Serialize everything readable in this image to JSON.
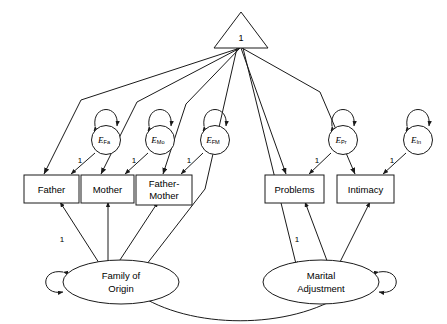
{
  "diagram": {
    "type": "sem-path-diagram",
    "constant": {
      "shape": "triangle",
      "label": "1",
      "name": "constant-triangle"
    },
    "latent_variables": [
      {
        "id": "family-of-origin",
        "label_line1": "Family of",
        "label_line2": "Origin",
        "shape": "ellipse",
        "self_loop": "left"
      },
      {
        "id": "marital-adjustment",
        "label_line1": "Marital",
        "label_line2": "Adjustment",
        "shape": "ellipse",
        "self_loop": "right"
      }
    ],
    "indicators": [
      {
        "id": "father",
        "label_line1": "Father",
        "label_line2": "",
        "shape": "rect"
      },
      {
        "id": "mother",
        "label_line1": "Mother",
        "label_line2": "",
        "shape": "rect"
      },
      {
        "id": "father-mother",
        "label_line1": "Father-",
        "label_line2": "Mother",
        "shape": "rect"
      },
      {
        "id": "problems",
        "label_line1": "Problems",
        "label_line2": "",
        "shape": "rect"
      },
      {
        "id": "intimacy",
        "label_line1": "Intimacy",
        "label_line2": "",
        "shape": "rect"
      }
    ],
    "errors": [
      {
        "id": "e-fa",
        "base": "E",
        "subscript": "Fa",
        "shape": "circle",
        "self_loop": "top"
      },
      {
        "id": "e-mo",
        "base": "E",
        "subscript": "Mo",
        "shape": "circle",
        "self_loop": "top"
      },
      {
        "id": "e-fm",
        "base": "E",
        "subscript": "FM",
        "shape": "circle",
        "self_loop": "top"
      },
      {
        "id": "e-pr",
        "base": "E",
        "subscript": "Pr",
        "shape": "circle",
        "self_loop": "top"
      },
      {
        "id": "e-in",
        "base": "E",
        "subscript": "In",
        "shape": "circle",
        "self_loop": "top"
      }
    ],
    "coefficients": {
      "err_fa_to_father": "1",
      "err_mo_to_mother": "1",
      "err_fm_to_fathermother": "1",
      "err_pr_to_problems": "1",
      "err_in_to_intimacy": "1",
      "foo_to_father": "1",
      "ma_to_problems": "1"
    },
    "colors": {
      "stroke": "#1a1a1a",
      "fill": "#ffffff",
      "text": "#000000"
    }
  }
}
